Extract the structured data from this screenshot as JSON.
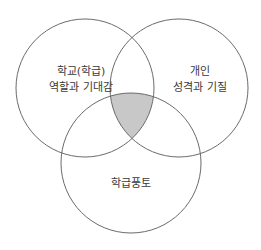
{
  "diagram": {
    "type": "venn",
    "stroke_color": "#6b6b6b",
    "highlight_fill": "#c8c8c8",
    "circles": [
      {
        "id": "left",
        "lines": [
          "학교(학급)",
          "역할과 기대감"
        ]
      },
      {
        "id": "right",
        "lines": [
          "개인",
          "성격과 기질"
        ]
      },
      {
        "id": "bottom",
        "lines": [
          "학급풍토"
        ]
      }
    ],
    "highlighted_region": "intersection of all three circles"
  }
}
